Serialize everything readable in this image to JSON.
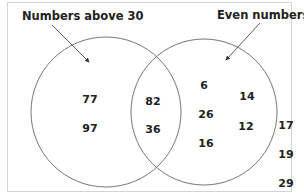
{
  "diagram": {
    "type": "venn",
    "sets": [
      {
        "id": "A",
        "label": "Numbers above 30"
      },
      {
        "id": "B",
        "label": "Even numbers"
      }
    ],
    "regions": {
      "only_A": [
        "77",
        "97"
      ],
      "A_and_B": [
        "82",
        "36"
      ],
      "only_B": [
        "6",
        "14",
        "26",
        "12",
        "16"
      ],
      "outside": [
        "17",
        "19",
        "29"
      ]
    }
  }
}
